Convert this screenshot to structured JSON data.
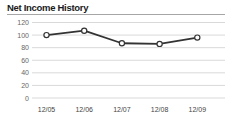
{
  "chart_data": {
    "type": "line",
    "title": "Net Income History",
    "categories": [
      "12/05",
      "12/06",
      "12/07",
      "12/08",
      "12/09"
    ],
    "values": [
      100,
      107,
      87,
      86,
      96
    ],
    "xlabel": "",
    "ylabel": "",
    "ylim": [
      0,
      120
    ],
    "yticks": [
      0,
      20,
      40,
      60,
      80,
      100,
      120
    ],
    "grid": true,
    "legend": "none",
    "marker": "open-circle",
    "colors": {
      "title": "#1b1b1b",
      "title_rule": "#a6a6a6",
      "grid": "#d9d9d9",
      "line": "#333333",
      "marker_fill": "#ffffff",
      "y_tick_label": "#666666",
      "x_tick_label": "#444444",
      "background": "#ffffff"
    }
  }
}
